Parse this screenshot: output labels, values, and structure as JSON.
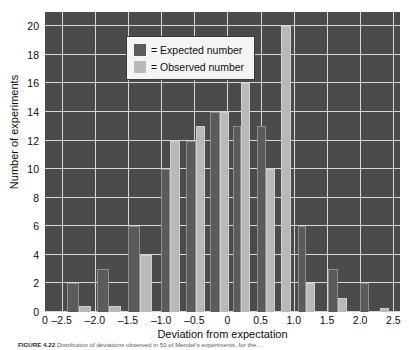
{
  "figure": {
    "caption_label": "FIGURE 4.22",
    "caption_text": "Distribution of deviations observed in 50 of Mendel's experiments, for the..."
  },
  "legend": {
    "position": "top-left-inside",
    "items": [
      {
        "key": "expected",
        "label": "= Expected number",
        "color": "#5b5b5b"
      },
      {
        "key": "observed",
        "label": "= Observed number",
        "color": "#b9b9b9"
      }
    ]
  },
  "chart_data": {
    "type": "bar",
    "title": "",
    "subtitle": "",
    "xlabel": "Deviation from expectation",
    "ylabel": "Number of experiments",
    "xlim": [
      -2.75,
      2.6
    ],
    "ylim": [
      0,
      21
    ],
    "ytick_step": 2,
    "grid": true,
    "plot_background": "#4b4b4b",
    "gridline_color": "#d8d8d8",
    "xticks": [
      {
        "value": -2.75,
        "label": "0"
      },
      {
        "value": -2.5,
        "label": "–2.5"
      },
      {
        "value": -2.0,
        "label": "–2.0"
      },
      {
        "value": -1.5,
        "label": "–1.5"
      },
      {
        "value": -1.0,
        "label": "–1.0"
      },
      {
        "value": -0.5,
        "label": "–0.5"
      },
      {
        "value": 0.0,
        "label": "0"
      },
      {
        "value": 0.5,
        "label": "0.5"
      },
      {
        "value": 1.0,
        "label": "1.0"
      },
      {
        "value": 1.5,
        "label": "1.5"
      },
      {
        "value": 2.0,
        "label": "2.0"
      },
      {
        "value": 2.5,
        "label": "2.5"
      }
    ],
    "yticks": [
      {
        "value": 0,
        "label": "0"
      },
      {
        "value": 2,
        "label": "2"
      },
      {
        "value": 4,
        "label": "4"
      },
      {
        "value": 6,
        "label": "6"
      },
      {
        "value": 8,
        "label": "8"
      },
      {
        "value": 10,
        "label": "10"
      },
      {
        "value": 12,
        "label": "12"
      },
      {
        "value": 14,
        "label": "14"
      },
      {
        "value": 16,
        "label": "16"
      },
      {
        "value": 18,
        "label": "18"
      },
      {
        "value": 20,
        "label": "20"
      }
    ],
    "categories": [
      -2.3,
      -1.85,
      -1.35,
      -0.85,
      -0.4,
      0.05,
      0.4,
      0.8,
      1.2,
      1.65,
      2.1,
      2.4
    ],
    "series": [
      {
        "name": "Expected number",
        "color": "#5b5b5b",
        "values": [
          2,
          3,
          6,
          10,
          12,
          14,
          13,
          13,
          6,
          3,
          2,
          0
        ]
      },
      {
        "name": "Observed number",
        "color": "#b9b9b9",
        "values": [
          0.4,
          0.4,
          4,
          12,
          13,
          14,
          16,
          20,
          10,
          2,
          1,
          0.3
        ]
      }
    ],
    "bars": [
      {
        "series": "expected",
        "x_left": -2.42,
        "x_right": -2.24,
        "value": 2
      },
      {
        "series": "observed",
        "x_left": -2.24,
        "x_right": -2.06,
        "value": 0.4
      },
      {
        "series": "expected",
        "x_left": -1.96,
        "x_right": -1.78,
        "value": 3
      },
      {
        "series": "observed",
        "x_left": -1.78,
        "x_right": -1.6,
        "value": 0.4
      },
      {
        "series": "expected",
        "x_left": -1.5,
        "x_right": -1.32,
        "value": 6
      },
      {
        "series": "observed",
        "x_left": -1.32,
        "x_right": -1.14,
        "value": 4
      },
      {
        "series": "expected",
        "x_left": -1.0,
        "x_right": -0.86,
        "value": 10
      },
      {
        "series": "observed",
        "x_left": -0.86,
        "x_right": -0.72,
        "value": 12
      },
      {
        "series": "expected",
        "x_left": -0.62,
        "x_right": -0.48,
        "value": 12
      },
      {
        "series": "observed",
        "x_left": -0.48,
        "x_right": -0.34,
        "value": 13
      },
      {
        "series": "expected",
        "x_left": -0.26,
        "x_right": -0.12,
        "value": 14
      },
      {
        "series": "observed",
        "x_left": -0.12,
        "x_right": 0.02,
        "value": 14
      },
      {
        "series": "expected",
        "x_left": 0.08,
        "x_right": 0.2,
        "value": 13
      },
      {
        "series": "observed",
        "x_left": 0.2,
        "x_right": 0.34,
        "value": 16
      },
      {
        "series": "expected",
        "x_left": 0.44,
        "x_right": 0.58,
        "value": 13
      },
      {
        "series": "observed",
        "x_left": 0.58,
        "x_right": 0.72,
        "value": 10
      },
      {
        "series": "observed",
        "x_left": 0.8,
        "x_right": 0.96,
        "value": 20
      },
      {
        "series": "expected",
        "x_left": 1.06,
        "x_right": 1.18,
        "value": 6
      },
      {
        "series": "observed",
        "x_left": 1.18,
        "x_right": 1.32,
        "value": 2
      },
      {
        "series": "expected",
        "x_left": 1.52,
        "x_right": 1.66,
        "value": 3
      },
      {
        "series": "observed",
        "x_left": 1.66,
        "x_right": 1.8,
        "value": 1
      },
      {
        "series": "expected",
        "x_left": 2.0,
        "x_right": 2.14,
        "value": 2
      },
      {
        "series": "observed",
        "x_left": 2.3,
        "x_right": 2.44,
        "value": 0.3
      }
    ]
  }
}
